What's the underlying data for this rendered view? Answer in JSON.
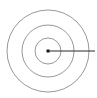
{
  "figure": {
    "name": "concentric-circles-with-radius",
    "canvas": {
      "width": 97,
      "height": 98,
      "background": "#ffffff"
    },
    "center": {
      "x": 48,
      "y": 51
    },
    "center_point": {
      "label": "center-point",
      "shape": "square-dot",
      "size": 3,
      "color": "#1a1a1a"
    },
    "circles": [
      {
        "label": "inner-circle",
        "radius": 13,
        "stroke": "#8c8c8c",
        "stroke_width": 0.9,
        "fill": "none"
      },
      {
        "label": "middle-circle",
        "radius": 26,
        "stroke": "#8c8c8c",
        "stroke_width": 0.9,
        "fill": "none"
      },
      {
        "label": "outer-circle",
        "radius": 41,
        "stroke": "#8c8c8c",
        "stroke_width": 0.9,
        "fill": "none"
      }
    ],
    "radius_line": {
      "label": "radius-line",
      "x1": 48,
      "y1": 51,
      "x2": 95,
      "y2": 51,
      "stroke": "#2b2b2b",
      "stroke_width": 1
    },
    "labels": [],
    "annotations": []
  }
}
